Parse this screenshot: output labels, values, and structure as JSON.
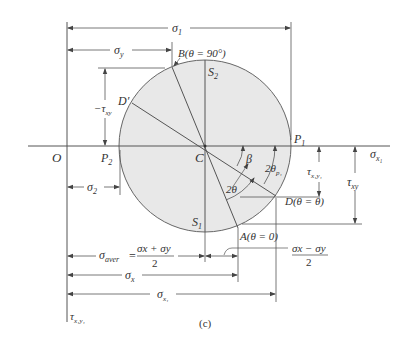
{
  "figure": {
    "type": "Mohr's circle for plane stress",
    "caption": "(c)",
    "colors": {
      "circle_fill": "#e8e8e8",
      "line": "#555555",
      "text": "#333333",
      "background": "#ffffff"
    },
    "axes": {
      "horizontal_label": "σ",
      "horizontal_sub": "x₁",
      "vertical_label": "τ",
      "vertical_sub": "x₁y₁",
      "origin_label": "O"
    },
    "points": {
      "center": "C",
      "p1": "P",
      "p1_sub": "1",
      "p2": "P",
      "p2_sub": "2",
      "s1": "S",
      "s1_sub": "1",
      "s2": "S",
      "s2_sub": "2",
      "a": "A(θ = 0)",
      "b": "B(θ = 90°)",
      "d": "D(θ = θ)",
      "d_prime": "D′"
    },
    "angles": {
      "beta": "β",
      "two_theta": "2θ",
      "two_theta_p1": "2θ",
      "two_theta_p1_sub": "p₁"
    },
    "dimensions": {
      "sigma1": "σ",
      "sigma1_sub": "1",
      "sigma_y": "σ",
      "sigma_y_sub": "y",
      "neg_tau_xy": "−τ",
      "neg_tau_xy_sub": "xy",
      "sigma2": "σ",
      "sigma2_sub": "2",
      "sigma_aver": "σ",
      "sigma_aver_sub": "aver",
      "sigma_aver_eq": "=",
      "sigma_aver_num": "σx + σy",
      "sigma_aver_den": "2",
      "half_diff_num": "σx − σy",
      "half_diff_den": "2",
      "sigma_x": "σ",
      "sigma_x_sub": "x",
      "sigma_x1": "σ",
      "sigma_x1_sub": "x₁",
      "tau_x1y1": "τ",
      "tau_x1y1_sub": "x₁y₁",
      "tau_xy": "τ",
      "tau_xy_sub": "xy"
    }
  }
}
